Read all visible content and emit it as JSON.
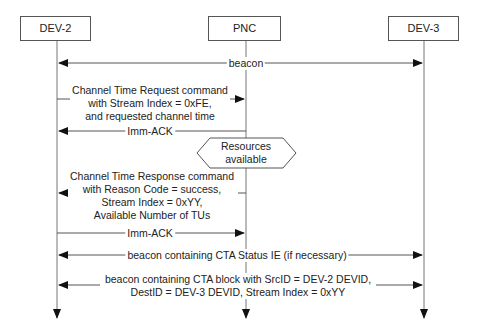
{
  "participants": [
    {
      "name": "DEV-2"
    },
    {
      "name": "PNC"
    },
    {
      "name": "DEV-3"
    }
  ],
  "messages": [
    {
      "label": "beacon",
      "from": "PNC",
      "to": "DEV-2, DEV-3"
    },
    {
      "lines": [
        "Channel Time Request command",
        "with Stream Index = 0xFE,",
        "and requested channel time"
      ],
      "from": "DEV-2",
      "to": "PNC"
    },
    {
      "label": "Imm-ACK",
      "from": "PNC",
      "to": "DEV-2"
    },
    {
      "lines": [
        "Channel Time Response command",
        "with Reason Code = success,",
        "Stream Index = 0xYY,",
        "Available Number of TUs"
      ],
      "from": "PNC",
      "to": "DEV-2"
    },
    {
      "label": "Imm-ACK",
      "from": "DEV-2",
      "to": "PNC"
    },
    {
      "label": "beacon containing CTA Status IE (if necessary)",
      "from": "PNC",
      "to": "DEV-2, DEV-3"
    },
    {
      "lines": [
        "beacon containing CTA block with SrcID = DEV-2 DEVID,",
        "DestID = DEV-3 DEVID, Stream Index = 0xYY"
      ],
      "from": "PNC",
      "to": "DEV-2, DEV-3"
    }
  ],
  "condition": {
    "lines": [
      "Resources",
      "available"
    ]
  }
}
